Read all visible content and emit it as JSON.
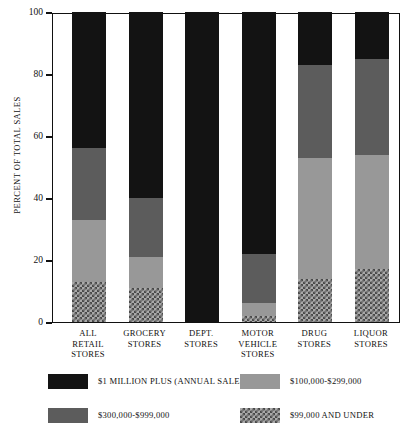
{
  "chart_data": {
    "type": "bar",
    "subtype": "stacked-100-percent",
    "title": "",
    "xlabel": "",
    "ylabel": "PERCENT OF TOTAL SALES",
    "ylim": [
      0,
      100
    ],
    "yticks": [
      0,
      20,
      40,
      60,
      80,
      100
    ],
    "grid": false,
    "legend_position": "bottom",
    "categories": [
      "ALL RETAIL STORES",
      "GROCERY STORES",
      "DEPT. STORES",
      "MOTOR VEHICLE STORES",
      "DRUG STORES",
      "LIQUOR STORES"
    ],
    "category_lines": [
      [
        "ALL",
        "RETAIL",
        "STORES"
      ],
      [
        "GROCERY",
        "STORES"
      ],
      [
        "DEPT.",
        "STORES"
      ],
      [
        "MOTOR",
        "VEHICLE",
        "STORES"
      ],
      [
        "DRUG",
        "STORES"
      ],
      [
        "LIQUOR",
        "STORES"
      ]
    ],
    "series": [
      {
        "name": "$1 MILLION PLUS (ANNUAL SALES)",
        "swatch": "black",
        "color": "#131313",
        "values": [
          44,
          60,
          100,
          78,
          17,
          15
        ]
      },
      {
        "name": "$300,000-$999,000",
        "swatch": "dark",
        "color": "#5c5c5c",
        "values": [
          23,
          19,
          0,
          16,
          30,
          31
        ]
      },
      {
        "name": "$100,000-$299,000",
        "swatch": "medium",
        "color": "#989898",
        "values": [
          20,
          10,
          0,
          4,
          39,
          37
        ]
      },
      {
        "name": "$99,000 AND UNDER",
        "swatch": "check",
        "color": "#a9a9a9",
        "values": [
          13,
          11,
          0,
          2,
          14,
          17
        ]
      }
    ]
  },
  "axis": {
    "y_title": "PERCENT OF TOTAL SALES",
    "tick_labels": [
      "0",
      "20",
      "40",
      "60",
      "80",
      "100"
    ]
  },
  "legend": {
    "items": [
      {
        "label": "$1 MILLION PLUS (ANNUAL SALES)",
        "swatch": "black"
      },
      {
        "label": "$100,000-$299,000",
        "swatch": "medium"
      },
      {
        "label": "$300,000-$999,000",
        "swatch": "dark"
      },
      {
        "label": "$99,000 AND UNDER",
        "swatch": "check"
      }
    ]
  }
}
